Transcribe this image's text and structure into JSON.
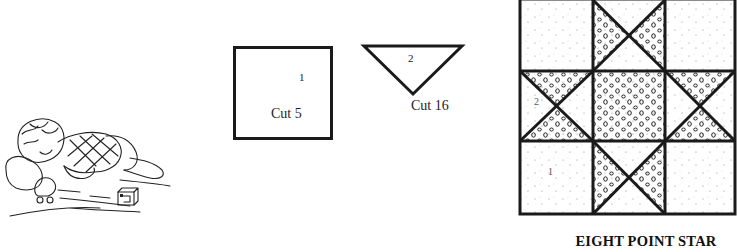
{
  "illustration": {
    "subject": "baby crawling on a quilt with toy duck and block",
    "icon": "baby-illustration-icon"
  },
  "pieces": [
    {
      "id": "piece-1",
      "shape": "square",
      "number_label": "1",
      "cut_label": "Cut 5"
    },
    {
      "id": "piece-2",
      "shape": "triangle",
      "number_label": "2",
      "cut_label": "Cut 16"
    }
  ],
  "block": {
    "title": "EIGHT POINT STAR",
    "labels": {
      "square": "1",
      "triangle": "2"
    },
    "grid": "3x3",
    "fabrics": {
      "background": "light dotted",
      "star": "circle print"
    }
  },
  "colors": {
    "line": "#1a1a1a",
    "background": "#ffffff",
    "dots": "#9a9a9a"
  }
}
